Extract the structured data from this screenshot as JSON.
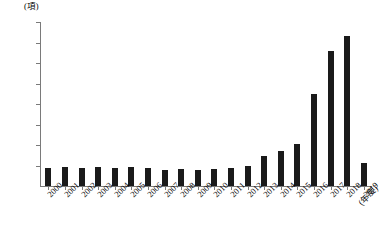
{
  "chart_data": {
    "type": "bar",
    "title": "",
    "subtitle": "",
    "xlabel": "(年度)",
    "ylabel": "(項)",
    "ylim": [
      0,
      8000
    ],
    "ytick_labels": [
      "8,000",
      "7,000",
      "6,000",
      "5,000",
      "4,000",
      "3,000",
      "2,000",
      "1,000",
      "0"
    ],
    "ytick_values": [
      8000,
      7000,
      6000,
      5000,
      4000,
      3000,
      2000,
      1000,
      0
    ],
    "grid": false,
    "legend": "none",
    "bar_color": "#1a1a1a",
    "axis_color": "#7a7a7a",
    "categories": [
      "2000",
      "2001",
      "2002",
      "2003",
      "2004",
      "2005",
      "2006",
      "2007",
      "2008",
      "2009",
      "2010",
      "2011",
      "2012",
      "2013",
      "2014",
      "2015",
      "2016",
      "2017",
      "2018",
      "2019"
    ],
    "values": [
      900,
      950,
      900,
      950,
      900,
      950,
      900,
      800,
      850,
      800,
      850,
      900,
      1000,
      1450,
      1700,
      2050,
      4500,
      6600,
      7300,
      1100
    ]
  }
}
